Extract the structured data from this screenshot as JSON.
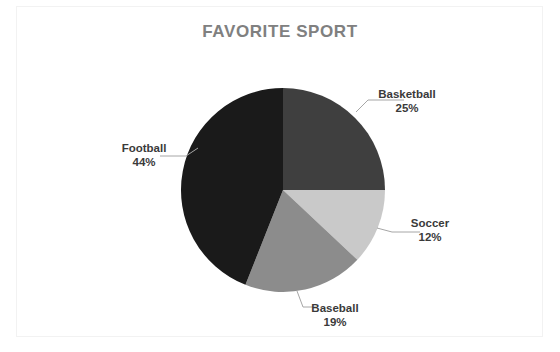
{
  "chart_data": {
    "type": "pie",
    "title": "FAVORITE SPORT",
    "xlabel": "",
    "ylabel": "",
    "grid": false,
    "legend": "none",
    "labels_position": "outside-with-leader-lines",
    "start_angle_deg": 0,
    "direction": "clockwise",
    "categories": [
      "Basketball",
      "Soccer",
      "Baseball",
      "Football"
    ],
    "values": [
      25,
      12,
      19,
      44
    ],
    "value_unit": "percent",
    "slices": [
      {
        "name": "Basketball",
        "value": 25,
        "percent_label": "25%",
        "color": "#3f3f3f",
        "start_deg": 0,
        "end_deg": 90
      },
      {
        "name": "Soccer",
        "value": 12,
        "percent_label": "12%",
        "color": "#c9c9c9",
        "start_deg": 90,
        "end_deg": 133.2
      },
      {
        "name": "Baseball",
        "value": 19,
        "percent_label": "19%",
        "color": "#8c8c8c",
        "start_deg": 133.2,
        "end_deg": 201.6
      },
      {
        "name": "Football",
        "value": 44,
        "percent_label": "44%",
        "color": "#1a1a1a",
        "start_deg": 201.6,
        "end_deg": 360
      }
    ],
    "geometry": {
      "center_x": 283,
      "center_y": 190,
      "radius": 102
    },
    "colors": {
      "title": "#808080",
      "label_text": "#3a3a3a",
      "leader_line": "#a6a6a6",
      "background": "#ffffff",
      "frame": "#f2f2f2"
    }
  }
}
